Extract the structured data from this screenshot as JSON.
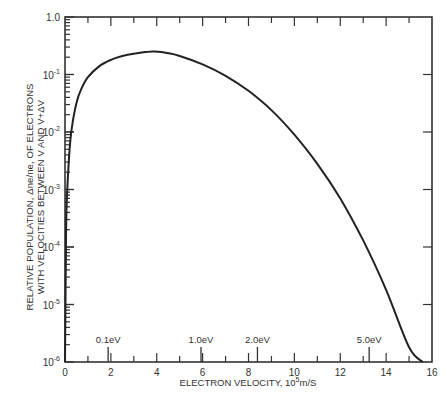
{
  "chart_data": {
    "type": "line",
    "title": "",
    "xlabel": "ELECTRON VELOCITY, 10^5 m/S",
    "xlabel_parts": {
      "main": "ELECTRON VELOCITY,  10",
      "sup": "5",
      "unit": "m/S"
    },
    "ylabel_line1": "RELATIVE POPULATION, Δne/ne, OF ELECTRONS",
    "ylabel_line2": "WITH VELOCITIES  BETWEEN V AND V+ΔV",
    "xlim": [
      0,
      16
    ],
    "ylim": [
      1e-06,
      1.0
    ],
    "yscale": "log",
    "x_ticks": [
      "0",
      "2",
      "4",
      "6",
      "8",
      "10",
      "12",
      "14",
      "16"
    ],
    "y_ticks": [
      {
        "base": "1.0",
        "exp": ""
      },
      {
        "base": "10",
        "exp": "-1"
      },
      {
        "base": "10",
        "exp": "-2"
      },
      {
        "base": "10",
        "exp": "-3"
      },
      {
        "base": "10",
        "exp": "-4"
      },
      {
        "base": "10",
        "exp": "-5"
      },
      {
        "base": "10",
        "exp": "-6"
      }
    ],
    "energy_markers": [
      {
        "label": "0.1eV",
        "x": 1.88
      },
      {
        "label": "1.0eV",
        "x": 5.93
      },
      {
        "label": "2.0eV",
        "x": 8.39
      },
      {
        "label": "5.0eV",
        "x": 13.26
      }
    ],
    "grid": false,
    "legend": null,
    "series": [
      {
        "name": "Relative electron population",
        "x": [
          0.0,
          0.05,
          0.1,
          0.2,
          0.3,
          0.5,
          0.7,
          1.0,
          1.5,
          2.0,
          2.5,
          3.0,
          3.5,
          3.9,
          4.5,
          5.0,
          6.0,
          7.0,
          8.0,
          9.0,
          10.0,
          11.0,
          12.0,
          13.0,
          14.0,
          15.0,
          15.6
        ],
        "y": [
          1e-06,
          0.0002,
          0.001,
          0.005,
          0.012,
          0.032,
          0.055,
          0.09,
          0.14,
          0.18,
          0.21,
          0.23,
          0.245,
          0.25,
          0.235,
          0.21,
          0.15,
          0.095,
          0.052,
          0.024,
          0.009,
          0.0028,
          0.0007,
          0.00013,
          1.8e-05,
          1.8e-06,
          1e-06
        ]
      }
    ]
  }
}
